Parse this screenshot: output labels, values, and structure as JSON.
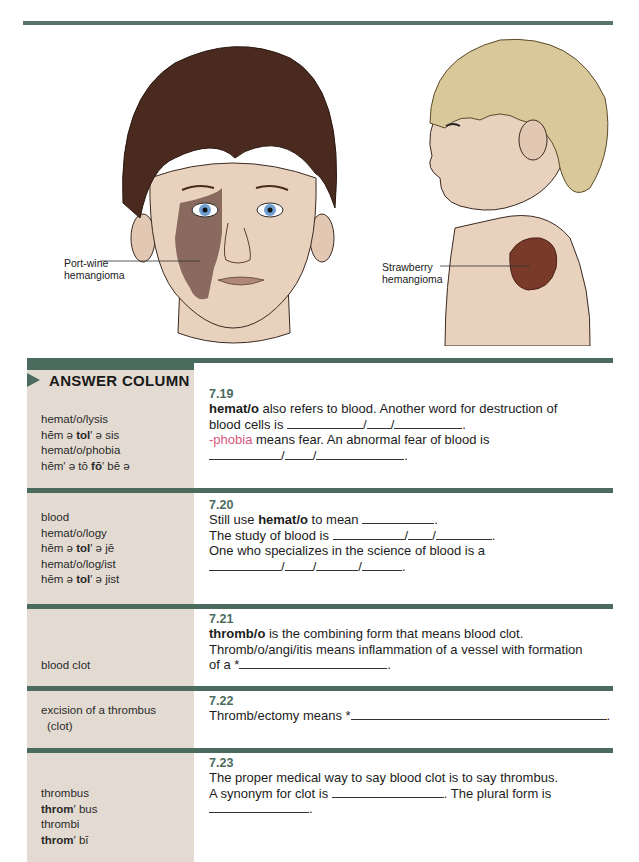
{
  "figure": {
    "labels": {
      "port_wine": [
        "Port-wine",
        "hemangioma"
      ],
      "strawberry": [
        "Strawberry",
        "hemangioma"
      ]
    },
    "colors": {
      "rule": "#56736a",
      "bar": "#4a6b5e",
      "answer_bg": "#e3dbd2",
      "skin": "#e8d2bd",
      "port_wine_stain": "#8a6a5e",
      "strawberry_mark": "#7a3a2a",
      "dark_hair": "#4a2a1e",
      "blond_hair": "#d9c99a",
      "eye_blue": "#6f9ed0"
    }
  },
  "answer_column": {
    "title": "ANSWER COLUMN"
  },
  "frames": [
    {
      "number": "7.19",
      "answers": [
        {
          "text": "hemat/o/lysis"
        },
        {
          "pre": "hĕm ə ",
          "bold": "tol",
          "post": "′ ə sis"
        },
        {
          "text": "hemat/o/phobia"
        },
        {
          "pre": "hĕm′ ə tō ",
          "bold": "fō",
          "post": "′ bē ə"
        }
      ],
      "line1_bold": "hemat/o",
      "line1_rest": " also refers to blood. Another word for destruction of",
      "line2_text": "blood cells is ",
      "line3_pink": "-phobia",
      "line3_rest": " means fear. An abnormal fear of blood is"
    },
    {
      "number": "7.20",
      "answers": [
        {
          "text": "blood"
        },
        {
          "text": "hemat/o/logy"
        },
        {
          "pre": "hēm ə ",
          "bold": "tol",
          "post": "′ ə jē"
        },
        {
          "text": "hemat/o/log/ist"
        },
        {
          "pre": "hēm ə ",
          "bold": "tol",
          "post": "′ ə jist"
        }
      ],
      "line1_pre": "Still use ",
      "line1_bold": "hemat/o",
      "line1_post": " to mean ",
      "line2_text": "The study of blood is ",
      "line3_text": "One who specializes in the science of blood is a"
    },
    {
      "number": "7.21",
      "answers": [
        {
          "text": "blood clot"
        }
      ],
      "line1_bold": "thromb/o",
      "line1_rest": " is the combining form that means blood clot.",
      "line2_text": "Thromb/o/angi/itis means inflammation of a vessel with formation",
      "line3_text": "of a *"
    },
    {
      "number": "7.22",
      "answers": [
        {
          "text": "excision of a thrombus"
        },
        {
          "text": "  (clot)"
        }
      ],
      "line1_text": "Thromb/ectomy means *"
    },
    {
      "number": "7.23",
      "answers": [
        {
          "text": "thrombus"
        },
        {
          "bold": "throm",
          "post": "′ bus"
        },
        {
          "text": "thrombi"
        },
        {
          "bold": "throm",
          "post": "′ bī"
        }
      ],
      "line1_text": "The proper medical way to say blood clot is to say thrombus.",
      "line2_pre": "A synonym for clot is ",
      "line2_post": ". The plural form is"
    }
  ],
  "punctuation": {
    "slash": "/",
    "period": "."
  }
}
